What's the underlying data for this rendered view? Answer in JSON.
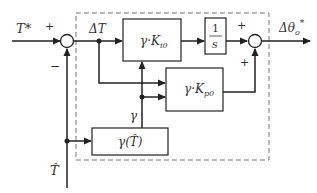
{
  "diagram": {
    "type": "control-block-diagram",
    "input_label": "T*",
    "feedback_label": "T̂",
    "error_label": "ΔT",
    "gain_label": "γ",
    "output_label": "Δθo*",
    "blocks": {
      "integral_gain": {
        "main": "γ·K",
        "sub": "i0"
      },
      "integrator": {
        "num": "1",
        "den": "s"
      },
      "proportional_gain": {
        "main": "γ·K",
        "sub": "p0"
      },
      "gamma_scheduler": {
        "text": "γ(T̂)"
      }
    },
    "sum1_signs": {
      "top": "+",
      "bottom": "−"
    },
    "sum2_signs": {
      "left": "+",
      "bottom": "+"
    },
    "colors": {
      "line": "#222222",
      "dashed": "#777777",
      "background": "#ffffff"
    }
  }
}
